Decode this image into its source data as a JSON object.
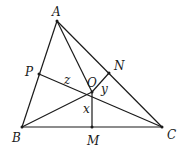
{
  "diagram": {
    "type": "triangle-geometry",
    "points": {
      "A": {
        "x": 57,
        "y": 21,
        "label": "A",
        "lx": 55,
        "ly": 16
      },
      "B": {
        "x": 22,
        "y": 127,
        "label": "B",
        "lx": 16,
        "ly": 142
      },
      "C": {
        "x": 162,
        "y": 127,
        "label": "C",
        "lx": 170,
        "ly": 139
      },
      "O": {
        "x": 92,
        "y": 92,
        "label": "O",
        "lx": 92,
        "ly": 87
      },
      "N": {
        "x": 109,
        "y": 73,
        "label": "N",
        "lx": 118,
        "ly": 70
      },
      "P": {
        "x": 39,
        "y": 74,
        "label": "P",
        "lx": 29,
        "ly": 76
      },
      "M": {
        "x": 92,
        "y": 127,
        "label": "M",
        "lx": 92,
        "ly": 145
      }
    },
    "segment_labels": {
      "x": {
        "text": "x",
        "lx": 86,
        "ly": 113
      },
      "y": {
        "text": "y",
        "lx": 104,
        "ly": 93
      },
      "z": {
        "text": "z",
        "lx": 67,
        "ly": 84
      }
    },
    "segments": [
      [
        "A",
        "B"
      ],
      [
        "B",
        "C"
      ],
      [
        "C",
        "A"
      ],
      [
        "A",
        "O"
      ],
      [
        "B",
        "O"
      ],
      [
        "P",
        "C"
      ],
      [
        "O",
        "N"
      ],
      [
        "O",
        "M"
      ]
    ]
  }
}
